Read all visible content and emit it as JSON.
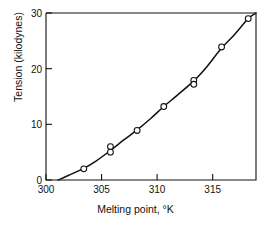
{
  "chart_data": {
    "type": "scatter",
    "title": "",
    "xlabel": "Melting point, °K",
    "ylabel": "Tension (kilodynes)",
    "xlim": [
      300,
      318.9
    ],
    "ylim": [
      0,
      30
    ],
    "xticks": [
      300,
      305,
      310,
      315
    ],
    "yticks": [
      0,
      10,
      20,
      30
    ],
    "xtick_labels": [
      "300",
      "305",
      "310",
      "315"
    ],
    "ytick_labels": [
      "0",
      "10",
      "20",
      "30"
    ],
    "grid": false,
    "legend": null,
    "marker": "open-circle",
    "line": "smooth-curve-fit",
    "line_color": "#111111",
    "marker_color": "#111111",
    "marker_fill": "#ffffff",
    "x": [
      303.4,
      305.8,
      305.8,
      308.2,
      310.6,
      313.3,
      313.3,
      315.8,
      318.2
    ],
    "y": [
      2.0,
      6.0,
      5.0,
      8.9,
      13.2,
      17.9,
      17.2,
      23.9,
      29.0
    ],
    "points": [
      {
        "x": 303.4,
        "y": 2.0
      },
      {
        "x": 305.8,
        "y": 6.0
      },
      {
        "x": 305.8,
        "y": 5.0
      },
      {
        "x": 308.2,
        "y": 8.9
      },
      {
        "x": 310.6,
        "y": 13.2
      },
      {
        "x": 313.3,
        "y": 17.9
      },
      {
        "x": 313.3,
        "y": 17.2
      },
      {
        "x": 315.8,
        "y": 23.9
      },
      {
        "x": 318.2,
        "y": 29.0
      }
    ],
    "fit_curve": [
      {
        "x": 301.1,
        "y": 0.0
      },
      {
        "x": 302.0,
        "y": 0.8
      },
      {
        "x": 303.4,
        "y": 2.1
      },
      {
        "x": 304.5,
        "y": 3.4
      },
      {
        "x": 305.8,
        "y": 5.3
      },
      {
        "x": 307.0,
        "y": 7.2
      },
      {
        "x": 308.2,
        "y": 9.0
      },
      {
        "x": 309.4,
        "y": 11.0
      },
      {
        "x": 310.6,
        "y": 13.2
      },
      {
        "x": 311.8,
        "y": 15.2
      },
      {
        "x": 313.3,
        "y": 17.8
      },
      {
        "x": 314.5,
        "y": 20.4
      },
      {
        "x": 315.8,
        "y": 23.7
      },
      {
        "x": 317.0,
        "y": 26.2
      },
      {
        "x": 318.2,
        "y": 29.0
      },
      {
        "x": 318.9,
        "y": 30.0
      }
    ]
  },
  "axes": {
    "x_axis_name": "melting-point-axis",
    "y_axis_name": "tension-axis"
  }
}
